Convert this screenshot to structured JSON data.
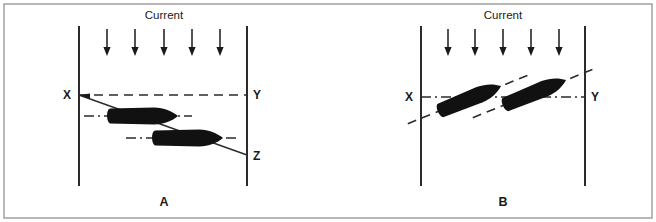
{
  "figure": {
    "background_color": "#ffffff",
    "border_color": "#9a9a9a",
    "ink_color": "#1a1a1a",
    "hull_color": "#111111"
  },
  "panels": [
    {
      "id": "A",
      "caption": "A",
      "current_label": "Current",
      "current_arrow_count": 5,
      "current_direction": "down",
      "bank_left_label": "X",
      "bank_right_label": "Y",
      "drift_end_label": "Z",
      "vessel_count": 2,
      "vessel_heading": "horizontal-right",
      "description": "Vessel heading straight across from X toward Y is set down-current and makes good the track X to Z."
    },
    {
      "id": "B",
      "caption": "B",
      "current_label": "Current",
      "current_arrow_count": 5,
      "current_direction": "down",
      "bank_left_label": "X",
      "bank_right_label": "Y",
      "vessel_count": 2,
      "vessel_heading": "angled-up-current",
      "description": "Vessel heading angled up-current crabs across and makes good the intended track X to Y."
    }
  ],
  "labels": {
    "x": "X",
    "y": "Y",
    "z": "Z",
    "current": "Current",
    "caption_a": "A",
    "caption_b": "B"
  }
}
